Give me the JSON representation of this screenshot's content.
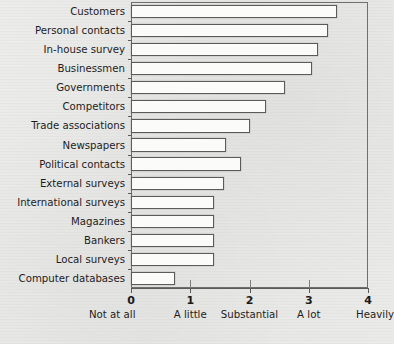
{
  "chart_data": {
    "type": "bar",
    "orientation": "horizontal",
    "title": "",
    "subtitle": "",
    "xlabel": "",
    "ylabel": "",
    "xlim": [
      0,
      4
    ],
    "ylim": null,
    "grid": false,
    "legend": null,
    "categories": [
      "Customers",
      "Personal contacts",
      "In-house survey",
      "Businessmen",
      "Governments",
      "Competitors",
      "Trade associations",
      "Newspapers",
      "Political contacts",
      "External surveys",
      "International surveys",
      "Magazines",
      "Bankers",
      "Local surveys",
      "Computer databases"
    ],
    "values": [
      3.48,
      3.33,
      3.15,
      3.05,
      2.6,
      2.28,
      2.0,
      1.6,
      1.85,
      1.57,
      1.4,
      1.4,
      1.4,
      1.4,
      0.74
    ],
    "x_tick_values": [
      0,
      1,
      2,
      3,
      4
    ],
    "x_tick_labels": [
      "0",
      "1",
      "2",
      "3",
      "4"
    ],
    "x_tick_words": [
      "Not at all",
      "A little",
      "Substantial",
      "A lot",
      "Heavily"
    ],
    "bar_fill_color": "#fbfbfa",
    "bar_edge_color": "#5b5b5b",
    "axis_color": "#5b5b5b",
    "background_color": "#e9e9e7",
    "text_color": "#1d1d1d"
  },
  "source_note": ""
}
